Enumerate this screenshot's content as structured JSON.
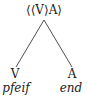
{
  "tree": {
    "root": {
      "label": "⟨⟨V⟩A⟩"
    },
    "children": [
      {
        "category": "V",
        "word": "pfeif"
      },
      {
        "category": "A",
        "word": "end"
      }
    ]
  }
}
